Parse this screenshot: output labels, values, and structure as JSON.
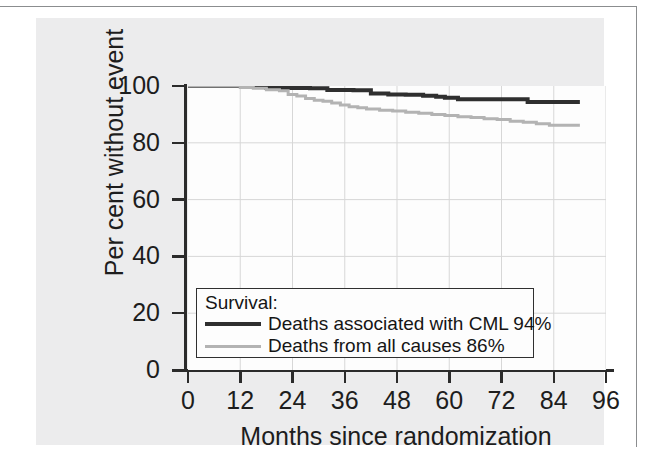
{
  "figure": {
    "panel_background": "#ececed",
    "plot_background": "#fdfdfd"
  },
  "chart_data": {
    "type": "line",
    "subtype": "kaplan-meier-step",
    "title": "",
    "xlabel": "Months since randomization",
    "ylabel": "Per cent without event",
    "xlim": [
      0,
      96
    ],
    "ylim": [
      0,
      100
    ],
    "xticks": [
      0,
      12,
      24,
      36,
      48,
      60,
      72,
      84,
      96
    ],
    "yticks": [
      0,
      20,
      40,
      60,
      80,
      100
    ],
    "grid": true,
    "legend_position": "lower-left-inside",
    "legend_title": "Survival:",
    "series": [
      {
        "name": "Deaths associated with CML 94%",
        "short_name": "Deaths associated with CML",
        "final_value_label": "94%",
        "color": "#2f2f2f",
        "linewidth": 4,
        "x": [
          0,
          10,
          14,
          18,
          22,
          28,
          32,
          34,
          38,
          42,
          46,
          50,
          54,
          57,
          59,
          62,
          66,
          70,
          74,
          78,
          82,
          86,
          90
        ],
        "y": [
          100,
          100,
          99.8,
          99.3,
          99.3,
          99.2,
          98.6,
          98.6,
          98.5,
          97.4,
          97.0,
          96.9,
          96.6,
          96.2,
          95.9,
          95.3,
          95.3,
          95.3,
          95.3,
          94.4,
          94.4,
          94.4,
          94.4
        ]
      },
      {
        "name": "Deaths from all causes 86%",
        "short_name": "Deaths from all causes",
        "final_value_label": "86%",
        "color": "#b3b3b3",
        "linewidth": 3,
        "x": [
          0,
          8,
          12,
          15,
          18,
          21,
          23,
          25,
          27,
          29,
          31,
          33,
          35,
          37,
          39,
          41,
          44,
          47,
          50,
          53,
          56,
          59,
          62,
          65,
          68,
          71,
          74,
          77,
          80,
          83,
          86,
          90
        ],
        "y": [
          100,
          100,
          99.5,
          99.2,
          98.7,
          98.3,
          97.0,
          96.5,
          95.6,
          95.0,
          94.6,
          94.0,
          93.3,
          92.7,
          92.3,
          91.9,
          91.5,
          91.2,
          90.8,
          90.4,
          90.0,
          89.6,
          89.2,
          88.9,
          88.5,
          88.2,
          87.6,
          87.2,
          86.7,
          86.2,
          86.2,
          86.2
        ]
      }
    ]
  }
}
